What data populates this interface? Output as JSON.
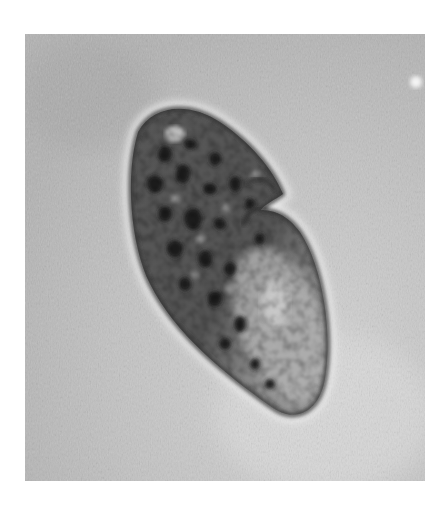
{
  "image": {
    "kind": "brightfield micrograph",
    "subject": "single-celled ciliate protozoan (kidney-shaped cell with notch)",
    "colors": {
      "background": "#b9b9b9",
      "background_light": "#d6d6d6",
      "background_dark_patch": "#a4a4a4",
      "membrane": "#3a3a3a",
      "halo": "#e6e6e6",
      "cytoplasm_dark": "#4a4a4a",
      "cytoplasm_mid": "#7a7a7a",
      "cytoplasm_light": "#b8b8b8",
      "granule": "#1e1e1e",
      "bright_spot": "#f2f2f2"
    },
    "photo_frame": {
      "x": 25,
      "y": 34,
      "width": 400,
      "height": 447
    }
  }
}
